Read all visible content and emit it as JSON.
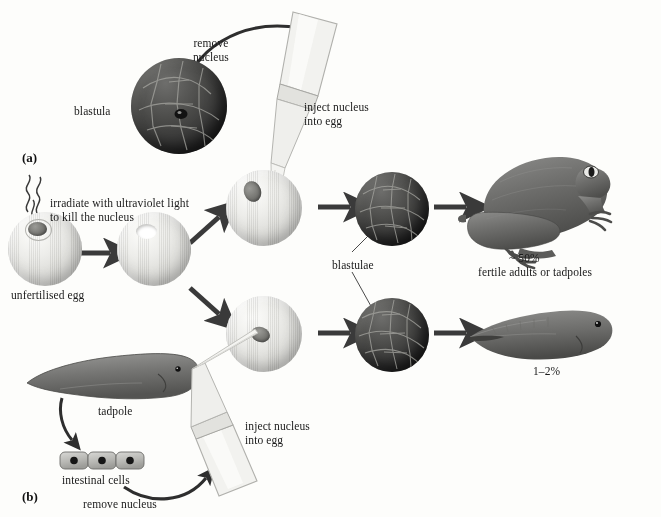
{
  "figure": {
    "panels": [
      {
        "id": "panel-a",
        "label": "(a)"
      },
      {
        "id": "panel-b",
        "label": "(b)"
      }
    ]
  },
  "panel_a": {
    "blastula_label": "blastula",
    "remove_nucleus_label": "remove\nnucleus",
    "inject_label": "inject nucleus\ninto egg"
  },
  "panel_b": {
    "irradiate_label": "irradiate with ultraviolet light\nto kill the nucleus",
    "unfertilised_egg_label": "unfertilised egg",
    "blastulae_label": "blastulae",
    "tadpole_label": "tadpole",
    "intestinal_cells_label": "intestinal cells",
    "remove_nucleus_label": "remove nucleus",
    "inject_label": "inject nucleus\ninto egg"
  },
  "outcomes": [
    {
      "name": "frog-outcome",
      "percent": "~ 50%",
      "description": "fertile adults or tadpoles"
    },
    {
      "name": "tadpole-outcome",
      "percent": "1–2%",
      "description": ""
    }
  ],
  "colors": {
    "background": "#fdfdfb",
    "text": "#1a1a1a",
    "arrow": "#3a3a3a",
    "egg_fill": "#e6e6e2",
    "blastula_fill": "#3a3a38",
    "animal_fill": "#6f6f6d"
  },
  "icons": {
    "arrow_right": "arrow-right-icon",
    "arrow_curve": "curved-arrow-icon",
    "uv_squiggle": "uv-light-icon"
  }
}
